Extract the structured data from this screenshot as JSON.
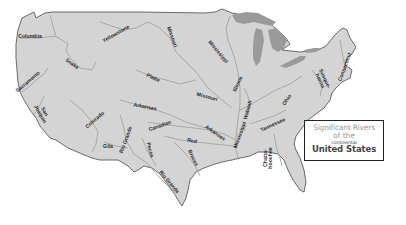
{
  "map": {
    "title": {
      "line1": "Significant Rivers",
      "line2": "of the",
      "line3": "continental",
      "line4": "United States"
    },
    "colors": {
      "land": "#d4d4d4",
      "water_lakes": "#9a9a9a",
      "rivers": "#9c9c9c",
      "outline": "#6a6a6a",
      "label_text": "#2a2a2a",
      "title_light": "#9a9a9a",
      "title_dark": "#444444",
      "background": "#ffffff"
    },
    "rivers": [
      {
        "name": "Columbia",
        "x": 30,
        "y": 37,
        "rotate": 0
      },
      {
        "name": "Snake",
        "x": 72,
        "y": 64,
        "rotate": 35
      },
      {
        "name": "Yellowstone",
        "x": 116,
        "y": 34,
        "rotate": -30
      },
      {
        "name": "Missouri",
        "x": 172,
        "y": 37,
        "rotate": 70
      },
      {
        "name": "Mississippi",
        "x": 218,
        "y": 52,
        "rotate": 50
      },
      {
        "name": "Sacramento",
        "x": 28,
        "y": 82,
        "rotate": -40
      },
      {
        "name": "Platte",
        "x": 153,
        "y": 78,
        "rotate": 25
      },
      {
        "name": "Missouri",
        "x": 207,
        "y": 97,
        "rotate": 15
      },
      {
        "name": "Illinois",
        "x": 238,
        "y": 84,
        "rotate": -65
      },
      {
        "name": "San\nJoaquin",
        "x": 42,
        "y": 113,
        "rotate": 60
      },
      {
        "name": "Colorado",
        "x": 95,
        "y": 120,
        "rotate": -40
      },
      {
        "name": "Arkansas",
        "x": 145,
        "y": 107,
        "rotate": 10
      },
      {
        "name": "Wabash",
        "x": 248,
        "y": 110,
        "rotate": -75
      },
      {
        "name": "Ohio",
        "x": 287,
        "y": 100,
        "rotate": -55
      },
      {
        "name": "Canadian",
        "x": 160,
        "y": 126,
        "rotate": -20
      },
      {
        "name": "Rio Grande",
        "x": 126,
        "y": 140,
        "rotate": -70
      },
      {
        "name": "Gila",
        "x": 108,
        "y": 147,
        "rotate": 0
      },
      {
        "name": "Arkansas",
        "x": 215,
        "y": 133,
        "rotate": 35
      },
      {
        "name": "Mississippi",
        "x": 240,
        "y": 135,
        "rotate": -70
      },
      {
        "name": "Tennessee",
        "x": 273,
        "y": 125,
        "rotate": -25
      },
      {
        "name": "Red",
        "x": 192,
        "y": 141,
        "rotate": 10
      },
      {
        "name": "Pecos",
        "x": 150,
        "y": 150,
        "rotate": 75
      },
      {
        "name": "Brazos",
        "x": 193,
        "y": 158,
        "rotate": 65
      },
      {
        "name": "Rio Grande",
        "x": 169,
        "y": 182,
        "rotate": 50
      },
      {
        "name": "Chatta-\nhoochee",
        "x": 268,
        "y": 158,
        "rotate": -90
      },
      {
        "name": "Susque-\nhanna",
        "x": 322,
        "y": 80,
        "rotate": 65
      },
      {
        "name": "Connecticut",
        "x": 345,
        "y": 67,
        "rotate": -70
      }
    ]
  }
}
